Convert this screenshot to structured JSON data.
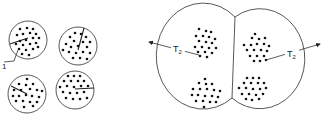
{
  "figure": {
    "background": "#ffffff",
    "stroke_color": "#444444",
    "dot_color": "#111111",
    "small_panel": {
      "label": "1",
      "cells": [
        {
          "cx": 28,
          "cy": 40,
          "r": 19,
          "radius_line": {
            "x1": 10,
            "y1": 43,
            "x2": 28,
            "y2": 38
          }
        },
        {
          "cx": 78,
          "cy": 46,
          "r": 19,
          "radius_line": {
            "x1": 83,
            "y1": 28,
            "x2": 78,
            "y2": 50
          }
        },
        {
          "cx": 27,
          "cy": 94,
          "r": 19,
          "radius_line": {
            "x1": 11,
            "y1": 86,
            "x2": 27,
            "y2": 94
          }
        },
        {
          "cx": 75,
          "cy": 90,
          "r": 19,
          "radius_line": {
            "x1": 94,
            "y1": 88,
            "x2": 75,
            "y2": 89
          }
        }
      ]
    },
    "large_panel": {
      "left_cell": {
        "cx": 192,
        "cy": 56,
        "r": 45
      },
      "right_cell": {
        "cx": 277,
        "cy": 59,
        "r": 44
      },
      "membrane": {
        "x1": 235,
        "y1": 17,
        "x2": 232,
        "y2": 98
      },
      "labels": [
        {
          "text": "T",
          "sub": "2",
          "x": 173,
          "y": 51
        },
        {
          "text": "T",
          "sub": "2",
          "x": 287,
          "y": 56
        }
      ]
    }
  }
}
